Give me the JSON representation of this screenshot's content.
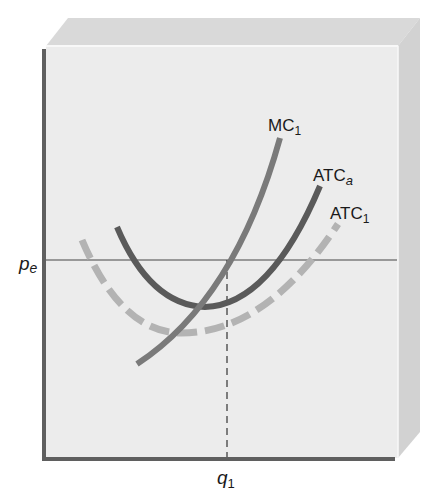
{
  "diagram": {
    "type": "cost-curves",
    "axes": {
      "y_tick_label": "p",
      "y_tick_sub": "e",
      "x_tick_label": "q",
      "x_tick_sub": "1"
    },
    "curves": [
      {
        "name": "MC",
        "label": "MC",
        "sub": "1",
        "style": "solid",
        "color": "#7a7a7a"
      },
      {
        "name": "ATCa",
        "label": "ATC",
        "sub": "a",
        "style": "solid",
        "color": "#5a5a5a"
      },
      {
        "name": "ATC1",
        "label": "ATC",
        "sub": "1",
        "style": "dashed",
        "color": "#b3b3b3"
      }
    ],
    "colors": {
      "panel_front": "#ececec",
      "panel_top": "#d9d9d9",
      "panel_side": "#d4d4d4",
      "axis": "#5f5f5f",
      "price_line": "#444444"
    }
  }
}
